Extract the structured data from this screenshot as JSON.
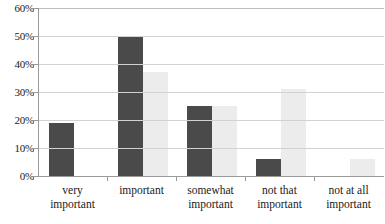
{
  "chart_data": {
    "type": "bar",
    "title": "",
    "subtitle": "",
    "xlabel": "",
    "ylabel": "",
    "ylim": [
      0,
      60
    ],
    "ytick_step": 10,
    "ytick_labels": [
      "0%",
      "10%",
      "20%",
      "30%",
      "40%",
      "50%",
      "60%"
    ],
    "ytick_values": [
      0,
      10,
      20,
      30,
      40,
      50,
      60
    ],
    "grid": true,
    "grid_axis": "y",
    "legend": false,
    "legend_position": "none",
    "value_suffix": "%",
    "categories": [
      "very important",
      "important",
      "somewhat important",
      "not that important",
      "not at all important"
    ],
    "category_lines": [
      [
        "very",
        "important"
      ],
      [
        "important",
        ""
      ],
      [
        "somewhat",
        "important"
      ],
      [
        "not that",
        "important"
      ],
      [
        "not at all",
        "important"
      ]
    ],
    "series": [
      {
        "name": "series-1",
        "color": "#4a4a4a",
        "values": [
          19,
          50,
          25,
          6,
          0
        ]
      },
      {
        "name": "series-2",
        "color": "#ececec",
        "values": [
          0,
          37,
          25,
          31,
          6
        ]
      }
    ]
  },
  "colors": {
    "series_dark": "#4a4a4a",
    "series_light": "#ececec",
    "gridline": "#d2d2d2",
    "axis": "#9a9a9a",
    "text": "#1a1a1a",
    "background": "#ffffff"
  }
}
